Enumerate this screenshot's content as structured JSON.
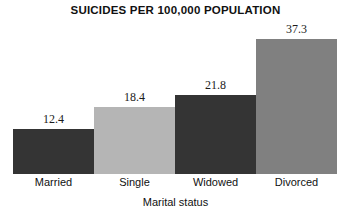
{
  "chart_data": {
    "type": "bar",
    "title": "SUICIDES PER 100,000 POPULATION",
    "xlabel": "Marital status",
    "ylabel": "",
    "categories": [
      "Married",
      "Single",
      "Widowed",
      "Divorced"
    ],
    "values": [
      12.4,
      18.4,
      21.8,
      37.3
    ],
    "value_labels": [
      "12.4",
      "18.4",
      "21.8",
      "37.3"
    ],
    "bar_colors": [
      "#343434",
      "#b5b5b5",
      "#343434",
      "#808080"
    ],
    "ylim": [
      0,
      41.5
    ],
    "grid": false,
    "legend": null,
    "axis_visible": false,
    "background": "#ffffff"
  }
}
